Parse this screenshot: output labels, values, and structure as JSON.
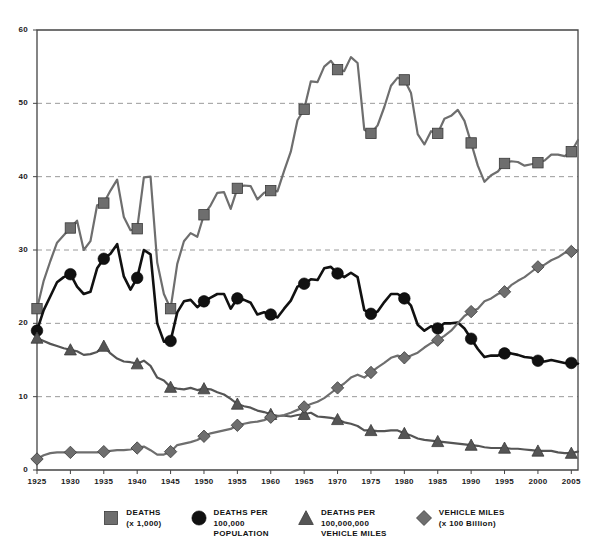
{
  "chart_data": {
    "type": "line",
    "title": "",
    "subtitle": "",
    "xlabel": "",
    "ylabel": "",
    "xlim": [
      1925,
      2006
    ],
    "ylim": [
      0,
      60
    ],
    "grid": "horizontal-dashed",
    "legend_position": "bottom-center",
    "y_ticks": [
      "0",
      "10",
      "20",
      "30",
      "40",
      "50",
      "60"
    ],
    "y_tick_values": [
      0,
      10,
      20,
      30,
      40,
      50,
      60
    ],
    "x_ticks": [
      "1925",
      "1930",
      "1935",
      "1940",
      "1945",
      "1950",
      "1955",
      "1960",
      "1965",
      "1970",
      "1975",
      "1980",
      "1985",
      "1990",
      "1995",
      "2000",
      "2005"
    ],
    "x_tick_values": [
      1925,
      1930,
      1935,
      1940,
      1945,
      1950,
      1955,
      1960,
      1965,
      1970,
      1975,
      1980,
      1985,
      1990,
      1995,
      2000,
      2005
    ],
    "x": [
      1925,
      1926,
      1927,
      1928,
      1929,
      1930,
      1931,
      1932,
      1933,
      1934,
      1935,
      1936,
      1937,
      1938,
      1939,
      1940,
      1941,
      1942,
      1943,
      1944,
      1945,
      1946,
      1947,
      1948,
      1949,
      1950,
      1951,
      1952,
      1953,
      1954,
      1955,
      1956,
      1957,
      1958,
      1959,
      1960,
      1961,
      1962,
      1963,
      1964,
      1965,
      1966,
      1967,
      1968,
      1969,
      1970,
      1971,
      1972,
      1973,
      1974,
      1975,
      1976,
      1977,
      1978,
      1979,
      1980,
      1981,
      1982,
      1983,
      1984,
      1985,
      1986,
      1987,
      1988,
      1989,
      1990,
      1991,
      1992,
      1993,
      1994,
      1995,
      1996,
      1997,
      1998,
      1999,
      2000,
      2001,
      2002,
      2003,
      2004,
      2005,
      2006
    ],
    "series": [
      {
        "name": "DEATHS (x 1,000)",
        "marker": "square",
        "color": "#6e6e6e",
        "marker_color": "#6e6e6e",
        "marker_years": [
          1925,
          1930,
          1935,
          1940,
          1945,
          1950,
          1955,
          1960,
          1965,
          1970,
          1975,
          1980,
          1985,
          1990,
          1995,
          2000,
          2005
        ],
        "values": [
          22.0,
          25.8,
          28.5,
          31.0,
          32.0,
          33.0,
          34.0,
          30.0,
          31.2,
          36.1,
          36.4,
          38.1,
          39.6,
          34.5,
          32.7,
          32.9,
          39.9,
          40.0,
          28.3,
          24.0,
          22.0,
          28.1,
          31.2,
          32.3,
          31.8,
          34.8,
          36.1,
          37.8,
          37.9,
          35.6,
          38.4,
          38.8,
          38.7,
          36.9,
          37.8,
          38.1,
          38.0,
          40.8,
          43.4,
          47.7,
          49.2,
          53.0,
          52.9,
          55.0,
          55.8,
          54.6,
          54.4,
          56.3,
          55.5,
          46.4,
          45.9,
          47.0,
          49.5,
          52.4,
          53.5,
          53.2,
          51.4,
          45.8,
          44.4,
          46.2,
          45.9,
          47.9,
          48.3,
          49.1,
          47.6,
          44.6,
          41.5,
          39.3,
          40.2,
          40.7,
          41.8,
          42.1,
          42.0,
          41.5,
          41.7,
          41.9,
          42.2,
          43.0,
          43.0,
          42.8,
          43.4,
          45.0
        ]
      },
      {
        "name": "DEATHS PER 100,000 POPULATION",
        "marker": "circle",
        "color": "#111111",
        "marker_color": "#111111",
        "marker_years": [
          1925,
          1930,
          1935,
          1940,
          1945,
          1950,
          1955,
          1960,
          1965,
          1970,
          1975,
          1980,
          1985,
          1990,
          1995,
          2000,
          2005
        ],
        "values": [
          19.0,
          21.8,
          23.7,
          25.6,
          26.3,
          26.7,
          25.0,
          24.0,
          24.3,
          27.5,
          28.8,
          29.5,
          30.8,
          26.4,
          24.6,
          26.2,
          30.0,
          29.4,
          20.0,
          17.5,
          17.6,
          21.5,
          23.0,
          23.2,
          22.2,
          23.0,
          23.5,
          24.0,
          24.0,
          22.0,
          23.4,
          23.2,
          22.8,
          21.2,
          21.5,
          21.2,
          20.8,
          22.0,
          23.1,
          25.0,
          25.4,
          26.0,
          25.9,
          27.5,
          27.7,
          26.8,
          26.3,
          26.9,
          26.3,
          21.8,
          21.3,
          21.6,
          22.9,
          24.0,
          24.0,
          23.4,
          22.4,
          19.8,
          19.0,
          19.6,
          19.3,
          20.0,
          20.0,
          20.1,
          19.3,
          17.9,
          16.5,
          15.4,
          15.6,
          15.6,
          15.9,
          15.9,
          15.7,
          15.4,
          15.3,
          14.9,
          14.8,
          15.0,
          14.8,
          14.6,
          14.6,
          14.5
        ]
      },
      {
        "name": "DEATHS PER 100,000,000 VEHICLE MILES",
        "marker": "triangle",
        "color": "#555555",
        "marker_color": "#555555",
        "marker_years": [
          1925,
          1930,
          1935,
          1940,
          1945,
          1950,
          1955,
          1960,
          1965,
          1970,
          1975,
          1980,
          1985,
          1990,
          1995,
          2000,
          2005
        ],
        "values": [
          18.0,
          17.6,
          17.2,
          16.9,
          16.6,
          16.4,
          16.2,
          15.7,
          15.8,
          16.1,
          16.9,
          15.9,
          15.2,
          14.8,
          14.7,
          14.5,
          14.9,
          14.2,
          12.6,
          12.2,
          11.3,
          11.1,
          11.0,
          11.2,
          10.9,
          11.1,
          11.0,
          10.6,
          10.3,
          9.7,
          9.0,
          8.7,
          8.5,
          8.1,
          7.9,
          7.6,
          7.4,
          7.4,
          7.3,
          7.5,
          7.6,
          7.8,
          7.3,
          7.2,
          7.1,
          6.9,
          6.5,
          6.3,
          6.0,
          5.4,
          5.4,
          5.3,
          5.3,
          5.4,
          5.4,
          5.0,
          4.7,
          4.3,
          4.1,
          4.0,
          3.9,
          3.8,
          3.7,
          3.6,
          3.5,
          3.4,
          3.3,
          3.1,
          3.0,
          3.0,
          3.0,
          2.9,
          2.9,
          2.8,
          2.7,
          2.6,
          2.6,
          2.6,
          2.4,
          2.3,
          2.3,
          2.5
        ]
      },
      {
        "name": "VEHICLE MILES (x 100 Billion)",
        "marker": "diamond",
        "color": "#6e6e6e",
        "marker_color": "#6e6e6e",
        "marker_years": [
          1925,
          1930,
          1935,
          1940,
          1945,
          1950,
          1955,
          1960,
          1965,
          1970,
          1975,
          1980,
          1985,
          1990,
          1995,
          2000,
          2005
        ],
        "values": [
          1.5,
          2.0,
          2.3,
          2.4,
          2.4,
          2.4,
          2.4,
          2.4,
          2.4,
          2.4,
          2.5,
          2.6,
          2.7,
          2.7,
          2.8,
          3.0,
          3.2,
          2.7,
          2.1,
          2.1,
          2.5,
          3.4,
          3.6,
          3.8,
          4.1,
          4.6,
          5.0,
          5.2,
          5.4,
          5.6,
          6.1,
          6.3,
          6.5,
          6.6,
          6.8,
          7.2,
          7.3,
          7.5,
          7.8,
          8.2,
          8.6,
          9.0,
          9.3,
          9.8,
          10.5,
          11.2,
          11.8,
          12.6,
          13.0,
          12.6,
          13.3,
          14.0,
          14.6,
          15.3,
          15.6,
          15.3,
          15.6,
          16.0,
          16.7,
          17.3,
          17.7,
          18.3,
          19.0,
          20.0,
          21.0,
          21.6,
          22.0,
          23.0,
          23.4,
          24.0,
          24.3,
          25.2,
          25.8,
          26.3,
          27.0,
          27.7,
          28.0,
          28.6,
          29.0,
          29.6,
          29.8,
          30.0
        ]
      }
    ]
  },
  "legend": {
    "items": [
      {
        "marker": "square",
        "line1": "DEATHS",
        "line2": "(x 1,000)",
        "line3": ""
      },
      {
        "marker": "circle",
        "line1": "DEATHS PER",
        "line2": "100,000",
        "line3": "POPULATION"
      },
      {
        "marker": "triangle",
        "line1": "DEATHS PER",
        "line2": "100,000,000",
        "line3": "VEHICLE MILES"
      },
      {
        "marker": "diamond",
        "line1": "VEHICLE MILES",
        "line2": "(x 100 Billion)",
        "line3": ""
      }
    ]
  },
  "colors": {
    "gray_series": "#6e6e6e",
    "black_series": "#111111",
    "triangle_series": "#555555",
    "axis": "#444444",
    "grid": "#9a9a9a",
    "text": "#1a1a1a",
    "background": "#ffffff"
  }
}
